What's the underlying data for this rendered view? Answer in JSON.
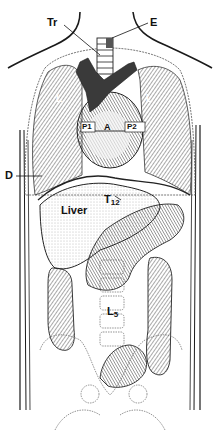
{
  "figure": {
    "colors": {
      "line": "#1a1a1a",
      "vessel": "#3a3a3a",
      "shade": "#8a8a8a",
      "bg": "#ffffff"
    },
    "labels": {
      "trachea": "Tr",
      "esophagus": "E",
      "lung_left": "L",
      "lung_right": "L",
      "pulmonary_1": "P1",
      "aorta": "A",
      "pulmonary_2": "P2",
      "diaphragm": "D",
      "liver": "Liver",
      "t12": "T",
      "t12_sub": "12",
      "l5": "L",
      "l5_sub": "5"
    }
  }
}
